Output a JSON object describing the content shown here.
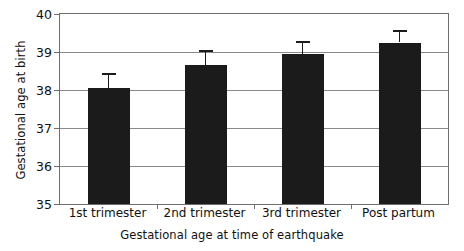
{
  "chart_data": {
    "type": "bar",
    "title": "",
    "subtitle": "",
    "xlabel": "Gestational age at time of earthquake",
    "ylabel": "Gestational age at birth",
    "categories": [
      "1st trimester",
      "2nd trimester",
      "3rd trimester",
      "Post partum"
    ],
    "values": [
      38.05,
      38.67,
      38.95,
      39.25
    ],
    "errors": [
      0.4,
      0.37,
      0.33,
      0.33
    ],
    "error_type": "symmetric",
    "ylim": [
      35,
      40
    ],
    "yticks": [
      35,
      36,
      37,
      38,
      39,
      40
    ],
    "ytick_labels": [
      "35",
      "36",
      "37",
      "38",
      "39",
      "40"
    ],
    "grid": true,
    "grid_axis": "y",
    "legend": false,
    "legend_position": "none",
    "bar_color": "#1b1b1b",
    "axis_color": "#6e6e6e",
    "grid_color": "#8a8a8a",
    "background_color": "#ffffff"
  }
}
